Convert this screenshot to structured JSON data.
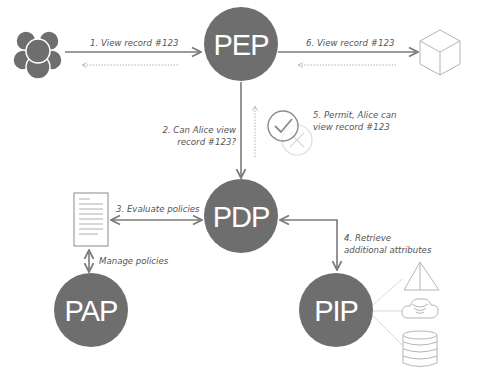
{
  "diagram": {
    "type": "access-control-architecture",
    "colors": {
      "node_fill": "#6e6e6e",
      "node_text": "#ffffff",
      "arrow": "#7a7a7a",
      "dotted_arrow": "#b0b0b0",
      "label": "#555555",
      "icon_outline": "#b5b5b5"
    },
    "nodes": {
      "pep": {
        "label": "PEP"
      },
      "pdp": {
        "label": "PDP"
      },
      "pap": {
        "label": "PAP"
      },
      "pip": {
        "label": "PIP"
      }
    },
    "icons": {
      "users": "users-group-icon",
      "resource": "cube-icon",
      "policy": "document-icon",
      "decision_permit": "checkmark-circle-icon",
      "decision_deny": "x-circle-icon",
      "sources": [
        "pyramid-icon",
        "cloud-icon",
        "database-icon"
      ]
    },
    "edges": {
      "e1": "1. View record #123",
      "e2_line1": "2. Can Alice view",
      "e2_line2": "record #123?",
      "e3": "3. Evaluate policies",
      "e4_line1": "4. Retrieve",
      "e4_line2": "additional attributes",
      "e5_line1": "5. Permit, Alice can",
      "e5_line2": "view record #123",
      "e6": "6. View record #123",
      "manage": "Manage policies"
    }
  }
}
